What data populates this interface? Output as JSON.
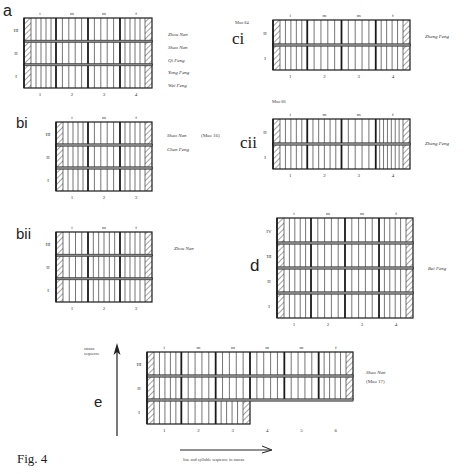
{
  "figure": {
    "caption": "Fig. 4",
    "x_axis_label": "line and syllable sequence in stanza",
    "y_axis_label": "stanza sequence"
  },
  "style": {
    "line_color": "#1a1a1a",
    "hatch_color": "#333333",
    "shade_color": "#888888"
  },
  "chart_data": [
    {
      "id": "a",
      "type": "table",
      "title": "a",
      "columns": [
        "1",
        "2",
        "3",
        "4"
      ],
      "section_labels": [
        "i",
        "m",
        "m",
        "f"
      ],
      "rows": [
        "III",
        "II",
        "I"
      ],
      "sub_lines_per_column": [
        4,
        4,
        4,
        4
      ],
      "sources": [
        "Zhou Nan",
        "Shao Nan",
        "Qi Feng",
        "Yong Feng",
        "Wei Feng"
      ],
      "box": {
        "x": 24,
        "y": 18,
        "w": 128,
        "h": 70
      }
    },
    {
      "id": "ci",
      "type": "table",
      "title": "ci",
      "note": "Mao 84",
      "columns": [
        "1",
        "2",
        "3",
        "4"
      ],
      "section_labels": [
        "i",
        "m",
        "m",
        "f"
      ],
      "rows": [
        "II",
        "I"
      ],
      "sub_lines_per_column": [
        4,
        4,
        4,
        4
      ],
      "sources": [
        "Zheng Feng"
      ],
      "box": {
        "x": 273,
        "y": 20,
        "w": 137,
        "h": 50
      }
    },
    {
      "id": "bi",
      "type": "table",
      "title": "bi",
      "note": "(Mao 16)",
      "columns": [
        "1",
        "2",
        "3"
      ],
      "section_labels": [
        "i",
        "m",
        "f"
      ],
      "rows": [
        "III",
        "II",
        "I"
      ],
      "sub_lines_per_column": [
        4,
        4,
        4
      ],
      "sources": [
        "Shao Nan",
        "Chen Feng"
      ],
      "box": {
        "x": 56,
        "y": 122,
        "w": 96,
        "h": 69
      }
    },
    {
      "id": "cii",
      "type": "table",
      "title": "cii",
      "note": "Mao 86",
      "columns": [
        "1",
        "2",
        "3",
        "4"
      ],
      "section_labels": [
        "i",
        "m",
        "m",
        "f"
      ],
      "rows": [
        "II",
        "I"
      ],
      "sub_lines_per_column": [
        4,
        5,
        4,
        6
      ],
      "sources": [
        "Zheng Feng"
      ],
      "box": {
        "x": 273,
        "y": 119,
        "w": 137,
        "h": 50
      }
    },
    {
      "id": "bii",
      "type": "table",
      "title": "bii",
      "columns": [
        "1",
        "2",
        "3"
      ],
      "section_labels": [
        "i",
        "m",
        "f"
      ],
      "rows": [
        "III",
        "II",
        "I"
      ],
      "sub_lines_per_column": [
        3,
        5,
        4
      ],
      "sources": [
        "Zhou Nan"
      ],
      "box": {
        "x": 56,
        "y": 232,
        "w": 96,
        "h": 70
      }
    },
    {
      "id": "d",
      "type": "table",
      "title": "d",
      "columns": [
        "1",
        "2",
        "3",
        "4"
      ],
      "section_labels": [
        "i",
        "m",
        "m",
        "f"
      ],
      "rows": [
        "IV",
        "III",
        "II",
        "I"
      ],
      "sub_lines_per_column": [
        4,
        4,
        4,
        4
      ],
      "sources": [
        "Bei Feng"
      ],
      "box": {
        "x": 277,
        "y": 218,
        "w": 136,
        "h": 100
      }
    },
    {
      "id": "e",
      "type": "table",
      "title": "e",
      "columns": [
        "1",
        "2",
        "3",
        "4",
        "5",
        "6"
      ],
      "section_labels": [
        "i",
        "m",
        "m",
        "m",
        "m",
        "f"
      ],
      "rows": [
        "III",
        "II",
        "I"
      ],
      "row_I_columns": 3,
      "sub_lines_per_column": [
        4,
        4,
        4,
        4,
        4,
        4
      ],
      "sources": [
        "Shao Nan",
        "(Mao 17)"
      ],
      "box": {
        "x": 147,
        "y": 352,
        "w": 206,
        "h": 72
      }
    }
  ],
  "labels": {
    "a": {
      "letter": "a",
      "sources": [
        "Zhou Nan",
        "Shao Nan",
        "Qi Feng",
        "Yong Feng",
        "Wei Feng"
      ]
    },
    "ci": {
      "letter": "ci",
      "note": "Mao 84",
      "source": "Zheng Feng"
    },
    "bi": {
      "letter": "bi",
      "source1": "Shao Nan",
      "note": "(Mao 16)",
      "source2": "Chen Feng"
    },
    "cii": {
      "letter": "cii",
      "note": "Mao 86",
      "source": "Zheng Feng"
    },
    "bii": {
      "letter": "bii",
      "source": "Zhou Nan"
    },
    "d": {
      "letter": "d",
      "source": "Bei Feng"
    },
    "e": {
      "letter": "e",
      "source": "Shao Nan",
      "note": "(Mao 17)"
    }
  }
}
